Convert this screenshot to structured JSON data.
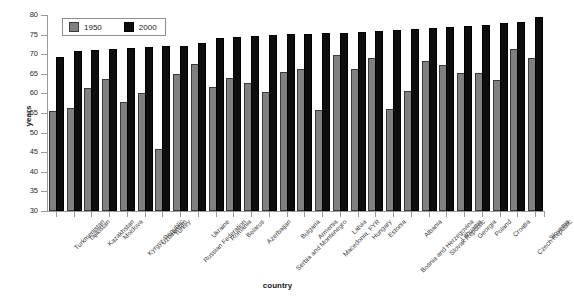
{
  "chart_data": {
    "type": "bar",
    "title": "",
    "xlabel": "country",
    "ylabel": "years",
    "ylim": [
      30,
      80
    ],
    "yticks": [
      30,
      35,
      40,
      45,
      50,
      55,
      60,
      65,
      70,
      75,
      80
    ],
    "grid": false,
    "legend_position": "top-left",
    "categories": [
      "Turkmenistan",
      "Tajikistan",
      "Kazakhstan",
      "Moldova",
      "Kyrgyz Republic",
      "Uzbekistan",
      "Turkey",
      "Russian Federation",
      "Ukraine",
      "Romania",
      "Belarus",
      "Azerbaijan",
      "Serbia and Montenegro",
      "Bulgaria",
      "Armenia",
      "Macedonia, FYR",
      "Latvia",
      "Hungary",
      "Estonia",
      "Bosnia and Herzegovina",
      "Albania",
      "Slovak Republic",
      "Lithuania",
      "Georgia",
      "Poland",
      "Croatia",
      "Czech Republic",
      "Slovenia"
    ],
    "series": [
      {
        "name": "1950",
        "color": "#808080",
        "values": [
          55.0,
          55.8,
          60.8,
          63.1,
          57.3,
          59.5,
          45.3,
          64.4,
          67.1,
          61.2,
          63.4,
          62.2,
          59.8,
          65.0,
          65.7,
          55.2,
          69.3,
          65.8,
          68.5,
          55.5,
          60.0,
          67.8,
          66.8,
          64.7,
          64.8,
          63.0,
          70.8,
          68.5
        ]
      },
      {
        "name": "2000",
        "color": "#0d0d0d",
        "values": [
          68.9,
          70.2,
          70.5,
          70.9,
          71.1,
          71.3,
          71.5,
          71.7,
          72.3,
          73.6,
          73.8,
          74.2,
          74.5,
          74.6,
          74.7,
          74.9,
          75.0,
          75.2,
          75.4,
          75.6,
          75.9,
          76.1,
          76.4,
          76.6,
          77.0,
          77.4,
          77.7,
          78.9
        ]
      }
    ]
  },
  "legend": {
    "items": [
      {
        "label": "1950",
        "color": "#808080"
      },
      {
        "label": "2000",
        "color": "#0d0d0d"
      }
    ]
  },
  "axes": {
    "y_title": "years",
    "x_title": "country"
  }
}
